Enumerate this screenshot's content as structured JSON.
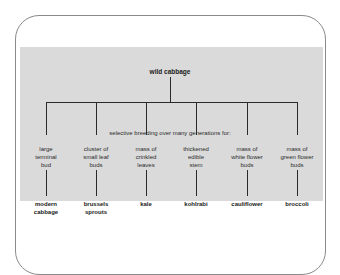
{
  "diagram": {
    "root": "wild cabbage",
    "process_label": "selective breeding over many generations for:",
    "branches": [
      {
        "trait": "large terminal bud",
        "trait_lines": [
          "large",
          "terminal",
          "bud"
        ],
        "crop_lines": [
          "modern",
          "cabbage"
        ],
        "crop": "modern cabbage"
      },
      {
        "trait": "cluster of small leaf buds",
        "trait_lines": [
          "cluster of",
          "small leaf",
          "buds"
        ],
        "crop_lines": [
          "brussels",
          "sprouts"
        ],
        "crop": "brussels sprouts"
      },
      {
        "trait": "mass of crinkled leaves",
        "trait_lines": [
          "mass of",
          "crinkled",
          "leaves"
        ],
        "crop_lines": [
          "kale"
        ],
        "crop": "kale"
      },
      {
        "trait": "thickened edible stem",
        "trait_lines": [
          "thickened",
          "edible",
          "stem"
        ],
        "crop_lines": [
          "kohlrabi"
        ],
        "crop": "kohlrabi"
      },
      {
        "trait": "mass of white flower buds",
        "trait_lines": [
          "mass of",
          "white flower",
          "buds"
        ],
        "crop_lines": [
          "cauliflower"
        ],
        "crop": "cauliflower"
      },
      {
        "trait": "mass of green flower buds",
        "trait_lines": [
          "mass of",
          "green flower",
          "buds"
        ],
        "crop_lines": [
          "broccoli"
        ],
        "crop": "broccoli"
      }
    ]
  },
  "colors": {
    "panel": "#dadada",
    "line": "#2a2a2a",
    "frame": "#8a8a8a"
  }
}
